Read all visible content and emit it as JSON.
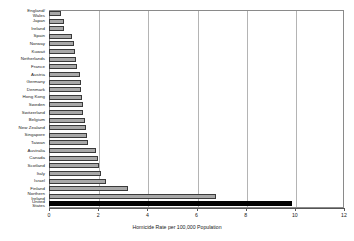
{
  "chart_data": {
    "type": "bar",
    "orientation": "horizontal",
    "title": "",
    "xlabel": "Homicide Rate per 100,000 Population",
    "ylabel": "",
    "xlim": [
      0,
      12
    ],
    "xticks": [
      0,
      2,
      4,
      6,
      8,
      10,
      12
    ],
    "grid": true,
    "legend": null,
    "bar_color": "#a8a8a8",
    "bar_edge_color": "#3a3a3a",
    "highlight_color": "#000000",
    "highlight_category": "United States",
    "categories": [
      "England/\nWales",
      "Japan",
      "Ireland",
      "Spain",
      "Norway",
      "Kuwait",
      "Netherlands",
      "France",
      "Austria",
      "Germany",
      "Denmark",
      "Hong Kong",
      "Sweden",
      "Switzerland",
      "Belgium",
      "New Zealand",
      "Singapore",
      "Taiwan",
      "Australia",
      "Canada",
      "Scotland",
      "Italy",
      "Israel",
      "Finland",
      "Northern\nIreland",
      "United\nStates"
    ],
    "values": [
      0.5,
      0.6,
      0.62,
      0.95,
      1.0,
      1.05,
      1.1,
      1.12,
      1.25,
      1.3,
      1.32,
      1.35,
      1.38,
      1.4,
      1.45,
      1.5,
      1.55,
      1.6,
      1.9,
      2.0,
      2.05,
      2.1,
      2.3,
      3.2,
      6.8,
      9.9
    ]
  }
}
